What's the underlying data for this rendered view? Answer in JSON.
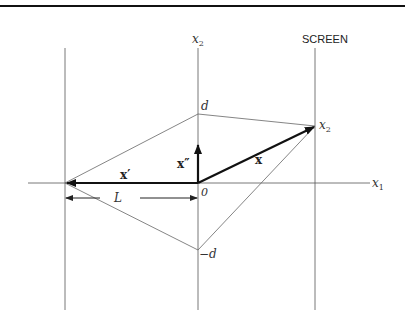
{
  "diagram": {
    "title_label": "SCREEN",
    "axes": {
      "x1": "x",
      "x1_sub": "1",
      "x2": "x",
      "x2_sub": "2"
    },
    "points": {
      "d": "d",
      "minus_d": "−d",
      "origin": "0",
      "screen_point": "x",
      "screen_point_sub": "2"
    },
    "vectors": {
      "x": "x",
      "x_prime": "x′",
      "x_double_prime": "x″"
    },
    "distance": {
      "L": "L"
    },
    "colors": {
      "thin_line": "#555555",
      "thick_arrow": "#111111",
      "top_rule": "#111111"
    }
  }
}
